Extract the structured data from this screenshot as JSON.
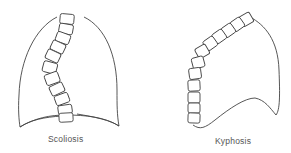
{
  "figures": [
    {
      "id": "scoliosis",
      "label": "Scoliosis"
    },
    {
      "id": "kyphosis",
      "label": "Kyphosis"
    }
  ],
  "colors": {
    "line": "#444444",
    "background": "#ffffff",
    "label": "#555555"
  }
}
